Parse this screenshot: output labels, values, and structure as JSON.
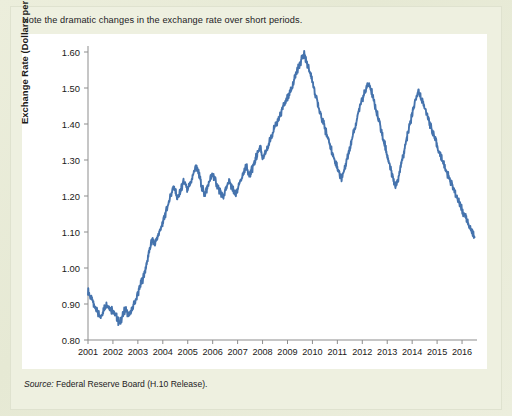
{
  "figure": {
    "caption": "Note the dramatic changes in the exchange rate over short periods.",
    "source_word": "Source:",
    "source_text": " Federal Reserve Board (H.10 Release).",
    "line_color": "#4573ad",
    "panel_color": "#ffffff",
    "background_color": "#eceedc"
  },
  "chart_data": {
    "type": "line",
    "title": "Note the dramatic changes in the exchange rate over short periods.",
    "xlabel": "",
    "ylabel": "Exchange Rate (Dollars per Euro)",
    "ylim": [
      0.8,
      1.6
    ],
    "xlim": [
      2001.0,
      2016.6
    ],
    "ytick_labels": [
      "1.60",
      "1.50",
      "1.40",
      "1.30",
      "1.20",
      "1.10",
      "1.00",
      "0.90",
      "0.80"
    ],
    "ytick_values": [
      1.6,
      1.5,
      1.4,
      1.3,
      1.2,
      1.1,
      1.0,
      0.9,
      0.8
    ],
    "xtick_labels": [
      "2001",
      "2002",
      "2003",
      "2004",
      "2005",
      "2006",
      "2007",
      "2008",
      "2009",
      "2010",
      "2011",
      "2012",
      "2013",
      "2014",
      "2015",
      "2016"
    ],
    "xtick_values": [
      2001,
      2002,
      2003,
      2004,
      2005,
      2006,
      2007,
      2008,
      2009,
      2010,
      2011,
      2012,
      2013,
      2014,
      2015,
      2016
    ],
    "grid": false,
    "legend": null,
    "series": [
      {
        "name": "Dollars per Euro",
        "color": "#4573ad",
        "x": [
          2001.0,
          2001.08,
          2001.17,
          2001.25,
          2001.33,
          2001.42,
          2001.5,
          2001.58,
          2001.67,
          2001.75,
          2001.83,
          2001.92,
          2002.0,
          2002.08,
          2002.17,
          2002.25,
          2002.33,
          2002.42,
          2002.5,
          2002.58,
          2002.67,
          2002.75,
          2002.83,
          2002.92,
          2003.0,
          2003.08,
          2003.17,
          2003.25,
          2003.33,
          2003.42,
          2003.5,
          2003.58,
          2003.67,
          2003.75,
          2003.83,
          2003.92,
          2004.0,
          2004.08,
          2004.17,
          2004.25,
          2004.33,
          2004.42,
          2004.5,
          2004.58,
          2004.67,
          2004.75,
          2004.83,
          2004.92,
          2005.0,
          2005.08,
          2005.17,
          2005.25,
          2005.33,
          2005.42,
          2005.5,
          2005.58,
          2005.67,
          2005.75,
          2005.83,
          2005.92,
          2006.0,
          2006.08,
          2006.17,
          2006.25,
          2006.33,
          2006.42,
          2006.5,
          2006.58,
          2006.67,
          2006.75,
          2006.83,
          2006.92,
          2007.0,
          2007.08,
          2007.17,
          2007.25,
          2007.33,
          2007.42,
          2007.5,
          2007.58,
          2007.67,
          2007.75,
          2007.83,
          2007.92,
          2008.0,
          2008.08,
          2008.17,
          2008.25,
          2008.33,
          2008.42,
          2008.5,
          2008.58,
          2008.67,
          2008.75,
          2008.83,
          2008.92,
          2009.0,
          2009.08,
          2009.17,
          2009.25,
          2009.33,
          2009.42,
          2009.5,
          2009.58,
          2009.67,
          2009.75,
          2009.83,
          2009.92,
          2010.0,
          2010.08,
          2010.17,
          2010.25,
          2010.33,
          2010.42,
          2010.5,
          2010.58,
          2010.67,
          2010.75,
          2010.83,
          2010.92,
          2011.0,
          2011.08,
          2011.17,
          2011.25,
          2011.33,
          2011.42,
          2011.5,
          2011.58,
          2011.67,
          2011.75,
          2011.83,
          2011.92,
          2012.0,
          2012.08,
          2012.17,
          2012.25,
          2012.33,
          2012.42,
          2012.5,
          2012.58,
          2012.67,
          2012.75,
          2012.83,
          2012.92,
          2013.0,
          2013.08,
          2013.17,
          2013.25,
          2013.33,
          2013.42,
          2013.5,
          2013.58,
          2013.67,
          2013.75,
          2013.83,
          2013.92,
          2014.0,
          2014.08,
          2014.17,
          2014.25,
          2014.33,
          2014.42,
          2014.5,
          2014.58,
          2014.67,
          2014.75,
          2014.83,
          2014.92,
          2015.0,
          2015.08,
          2015.17,
          2015.25,
          2015.33,
          2015.42,
          2015.5,
          2015.58,
          2015.67,
          2015.75,
          2015.83,
          2015.92,
          2016.0,
          2016.08,
          2016.17,
          2016.25,
          2016.33,
          2016.42,
          2016.5
        ],
        "y": [
          0.938,
          0.923,
          0.91,
          0.895,
          0.888,
          0.872,
          0.861,
          0.875,
          0.89,
          0.903,
          0.893,
          0.885,
          0.883,
          0.87,
          0.862,
          0.845,
          0.858,
          0.872,
          0.888,
          0.876,
          0.869,
          0.879,
          0.895,
          0.912,
          0.93,
          0.948,
          0.965,
          0.982,
          1.002,
          1.035,
          1.06,
          1.08,
          1.065,
          1.078,
          1.095,
          1.11,
          1.125,
          1.145,
          1.17,
          1.185,
          1.205,
          1.228,
          1.215,
          1.192,
          1.205,
          1.222,
          1.24,
          1.228,
          1.215,
          1.232,
          1.248,
          1.265,
          1.285,
          1.268,
          1.245,
          1.222,
          1.205,
          1.215,
          1.232,
          1.248,
          1.262,
          1.248,
          1.232,
          1.218,
          1.205,
          1.198,
          1.212,
          1.228,
          1.242,
          1.228,
          1.215,
          1.205,
          1.218,
          1.235,
          1.252,
          1.268,
          1.282,
          1.27,
          1.258,
          1.275,
          1.292,
          1.308,
          1.325,
          1.34,
          1.3,
          1.312,
          1.328,
          1.345,
          1.362,
          1.378,
          1.392,
          1.405,
          1.418,
          1.432,
          1.448,
          1.462,
          1.47,
          1.485,
          1.5,
          1.518,
          1.535,
          1.552,
          1.568,
          1.582,
          1.595,
          1.575,
          1.558,
          1.54,
          1.518,
          1.495,
          1.47,
          1.448,
          1.428,
          1.408,
          1.388,
          1.368,
          1.348,
          1.33,
          1.312,
          1.295,
          1.278,
          1.262,
          1.248,
          1.268,
          1.29,
          1.312,
          1.335,
          1.358,
          1.382,
          1.405,
          1.428,
          1.45,
          1.468,
          1.485,
          1.5,
          1.512,
          1.498,
          1.478,
          1.455,
          1.432,
          1.408,
          1.385,
          1.362,
          1.338,
          1.315,
          1.292,
          1.268,
          1.245,
          1.225,
          1.245,
          1.27,
          1.295,
          1.32,
          1.348,
          1.375,
          1.402,
          1.428,
          1.452,
          1.472,
          1.488,
          1.478,
          1.462,
          1.445,
          1.428,
          1.41,
          1.392,
          1.375,
          1.358,
          1.34,
          1.322,
          1.308,
          1.292,
          1.278,
          1.262,
          1.248,
          1.232,
          1.218,
          1.205,
          1.192,
          1.178,
          1.162,
          1.148,
          1.135,
          1.122,
          1.11,
          1.098,
          1.085
        ],
        "key_points": [
          {
            "year": 2001.0,
            "value": 0.94,
            "note": "series start"
          },
          {
            "year": 2001.6,
            "value": 0.84,
            "note": "trough — weakest euro"
          },
          {
            "year": 2004.9,
            "value": 1.36,
            "note": "2004 local peak"
          },
          {
            "year": 2005.9,
            "value": 1.18,
            "note": "2005 dip"
          },
          {
            "year": 2008.3,
            "value": 1.6,
            "note": "all-time peak"
          },
          {
            "year": 2008.9,
            "value": 1.25,
            "note": "financial-crisis drop"
          },
          {
            "year": 2009.9,
            "value": 1.51,
            "note": "2009 rebound peak"
          },
          {
            "year": 2010.5,
            "value": 1.2,
            "note": "2010 euro-crisis low"
          },
          {
            "year": 2011.3,
            "value": 1.48,
            "note": "2011 peak"
          },
          {
            "year": 2012.6,
            "value": 1.21,
            "note": "2012 low"
          },
          {
            "year": 2014.2,
            "value": 1.39,
            "note": "2014 high"
          },
          {
            "year": 2015.2,
            "value": 1.06,
            "note": "2015 low"
          },
          {
            "year": 2016.5,
            "value": 1.13,
            "note": "series end"
          }
        ]
      }
    ]
  }
}
